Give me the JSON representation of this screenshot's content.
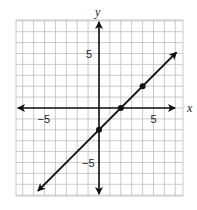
{
  "chart_data": {
    "type": "line",
    "title": "",
    "xlabel": "x",
    "ylabel": "y",
    "xlim": [
      -7.6,
      7.6
    ],
    "ylim": [
      -8.1,
      8.1
    ],
    "grid": true,
    "x_ticks_labeled": [
      -5,
      5
    ],
    "y_ticks_labeled": [
      5,
      -5
    ],
    "tick_labels": {
      "x_neg": "−5",
      "x_pos": "5",
      "y_pos": "5",
      "y_neg": "−5"
    },
    "series": [
      {
        "name": "y = x - 2",
        "slope": 1,
        "intercept": -2,
        "line_start": [
          -5.6,
          -7.6
        ],
        "line_end": [
          7.1,
          5.1
        ],
        "arrows": "both",
        "points": [
          [
            0,
            -2
          ],
          [
            2,
            0
          ],
          [
            4,
            2
          ]
        ]
      }
    ]
  },
  "colors": {
    "grid": "#bdbdbd",
    "axis": "#111111",
    "line": "#111111",
    "background": "#ffffff"
  },
  "layout": {
    "origin_px": [
      99,
      108
    ],
    "unit_px": 10.9,
    "grid_px": {
      "left": 16,
      "top": 20,
      "right": 183,
      "bottom": 196
    }
  }
}
